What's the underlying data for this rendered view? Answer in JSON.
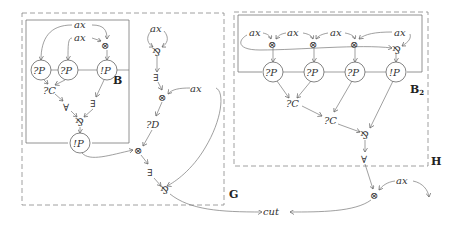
{
  "diagram": {
    "type": "proof-net",
    "boxes": [
      {
        "id": "G",
        "label": "G",
        "style": "dashed"
      },
      {
        "id": "B",
        "label": "B",
        "style": "solid"
      },
      {
        "id": "H",
        "label": "H",
        "style": "dashed"
      },
      {
        "id": "B2",
        "label": "B",
        "subscript": "2",
        "style": "solid"
      }
    ],
    "labels": {
      "ax": "ax",
      "tensor": "⊗",
      "par": "⅋",
      "why_not_P": "?P",
      "bang_P": "!P",
      "contraction": "?C",
      "dereliction": "?D",
      "forall": "∀",
      "exists": "∃",
      "cut": "cut"
    },
    "nodes_G": [
      "ax",
      "ax",
      "⊗",
      "?P",
      "?P",
      "!P",
      "?C",
      "∀",
      "∃",
      "⅋",
      "!P",
      "ax",
      "⅋",
      "∃",
      "⊗",
      "ax",
      "?D",
      "⊗",
      "∃",
      "⅋"
    ],
    "nodes_H": [
      "ax",
      "ax",
      "ax",
      "ax",
      "⊗",
      "⊗",
      "⊗",
      "⅋",
      "?P",
      "?P",
      "?P",
      "!P",
      "?C",
      "?C",
      "⅋",
      "∀"
    ],
    "nodes_outside": [
      "⊗",
      "ax",
      "cut"
    ]
  }
}
